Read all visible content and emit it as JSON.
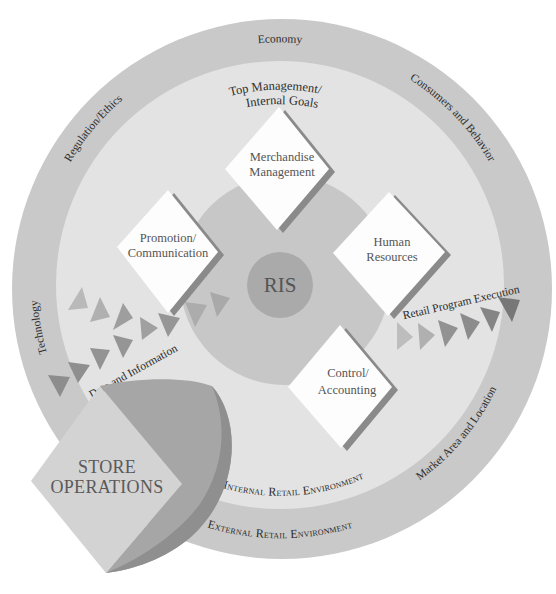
{
  "diagram": {
    "center": {
      "label": "RIS"
    },
    "top_goals": {
      "line1": "Top Management/",
      "line2": "Internal Goals"
    },
    "functions": [
      {
        "name": "merchandise",
        "lines": [
          "Merchandise",
          "Management"
        ]
      },
      {
        "name": "promotion",
        "lines": [
          "Promotion/",
          "Communication"
        ]
      },
      {
        "name": "human-resources",
        "lines": [
          "Human",
          "Resources"
        ]
      },
      {
        "name": "control",
        "lines": [
          "Control/",
          "Accounting"
        ]
      }
    ],
    "ring_labels": {
      "economy": "Economy",
      "regulation": "Regulation/Ethics",
      "consumers": "Consumers and Behavior",
      "technology": "Technology",
      "market": "Market Area and Location"
    },
    "flows": {
      "data_information": "Data and Information",
      "retail_program_execution": "Retail Program Execution"
    },
    "environments": {
      "internal": "Internal Retail Environment",
      "external": "External Retail Environment"
    },
    "store_operations": {
      "line1": "STORE",
      "line2": "OPERATIONS"
    }
  },
  "colors": {
    "outer_ring": "#c9c9c9",
    "inner_disk": "#e3e3e3",
    "central_circle": "#c7c7c7",
    "ris_circle": "#aaaaaa",
    "diamond": "#fdfdfd",
    "diamond_shadow": "#8a8a8a",
    "store_diamond": "#d3d3d3",
    "swoosh": "#a6a6a6",
    "swoosh_edge": "#8f8f8f"
  }
}
